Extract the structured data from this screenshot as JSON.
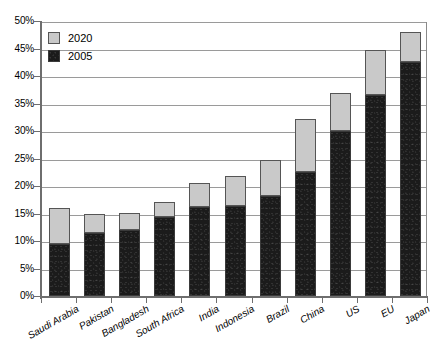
{
  "chart_data": {
    "type": "bar",
    "subtype": "stacked-bar",
    "title": "",
    "xlabel": "",
    "ylabel": "",
    "ylim": [
      0,
      50
    ],
    "y_tick_labels": [
      "0%",
      "5%",
      "10%",
      "15%",
      "20%",
      "25%",
      "30%",
      "35%",
      "40%",
      "45%",
      "50%"
    ],
    "y_tick_values": [
      0,
      5,
      10,
      15,
      20,
      25,
      30,
      35,
      40,
      45,
      50
    ],
    "grid": true,
    "legend_position": "top-left",
    "categories": [
      "Saudi Arabia",
      "Pakistan",
      "Bangladesh",
      "South Africa",
      "India",
      "Indonesia",
      "Brazil",
      "China",
      "US",
      "EU",
      "Japan"
    ],
    "series": [
      {
        "name": "2005",
        "color": "#1b1b1b",
        "values": [
          9.4,
          11.4,
          12.0,
          14.4,
          16.1,
          16.4,
          18.1,
          22.6,
          30.0,
          36.5,
          42.6
        ]
      },
      {
        "name": "2020",
        "color": "#c9c9c9",
        "values": [
          15.8,
          14.7,
          15.0,
          17.0,
          20.3,
          21.6,
          24.5,
          32.0,
          36.7,
          44.6,
          47.8
        ]
      }
    ],
    "stack_note": "2020 series is drawn as the bar total; the 2005 value is the dark lower portion of each bar."
  },
  "legend": {
    "items": [
      {
        "label": "2020",
        "swatch": "light-gray-swatch"
      },
      {
        "label": "2005",
        "swatch": "black-swatch"
      }
    ]
  },
  "colors": {
    "series_2005": "#1b1b1b",
    "series_2020": "#c9c9c9",
    "gridline": "#9a9a9a",
    "axis": "#6e6e6e",
    "plot_border": "#8a8a8a",
    "background": "#ffffff"
  }
}
